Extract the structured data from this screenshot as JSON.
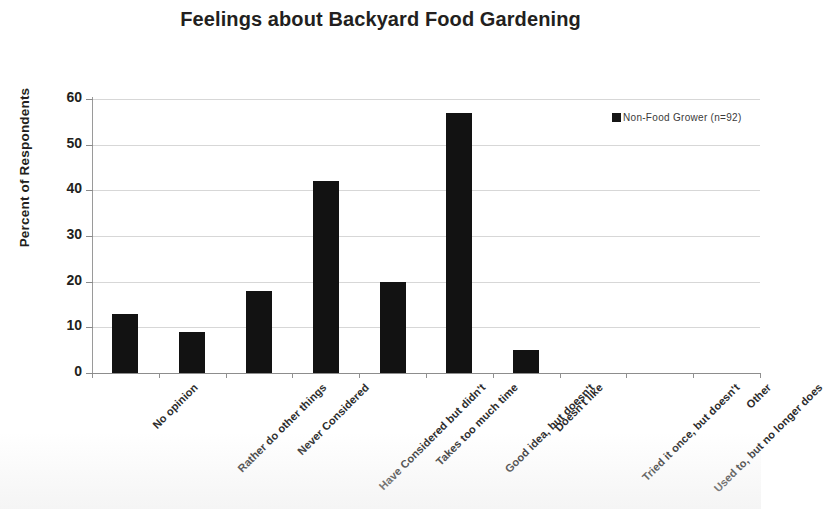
{
  "chart_data": {
    "type": "bar",
    "title": "Feelings about Backyard Food Gardening",
    "xlabel": "",
    "ylabel": "Percent of Respondents",
    "ylim": [
      0,
      60
    ],
    "yticks": [
      0,
      10,
      20,
      30,
      40,
      50,
      60
    ],
    "grid": true,
    "legend_position": "top-right",
    "categories": [
      "No opinion",
      "Rather do other things",
      "Never Considered",
      "Have Considered but didn't",
      "Takes too much time",
      "Good idea, but doesn't",
      "Doesn't like",
      "Tried it once, but doesn't",
      "Used to, but no longer does",
      "Other"
    ],
    "series": [
      {
        "name": "Non-Food Grower  (n=92)",
        "color": "#121212",
        "values": [
          13,
          9,
          18,
          42,
          20,
          57,
          5,
          0,
          0,
          0
        ]
      }
    ]
  },
  "legend": {
    "entries": [
      {
        "label": "Non-Food Grower  (n=92)",
        "color": "#121212"
      }
    ]
  },
  "axis": {
    "y_tick_labels": [
      "60",
      "50",
      "40",
      "30",
      "20",
      "10",
      "0"
    ]
  }
}
